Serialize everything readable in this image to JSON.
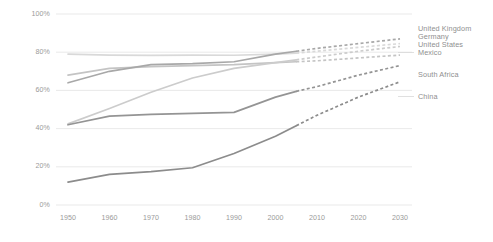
{
  "chart_data": {
    "type": "line",
    "title": "",
    "subtitle": "",
    "xlabel": "",
    "ylabel": "",
    "xlim": [
      1950,
      2030
    ],
    "ylim": [
      0,
      100
    ],
    "grid": true,
    "legend_position": "right",
    "x_ticks": [
      "1950",
      "1960",
      "1970",
      "1980",
      "1990",
      "2000",
      "2010",
      "2020",
      "2030"
    ],
    "y_ticks": [
      "0%",
      "20%",
      "40%",
      "60%",
      "80%",
      "100%"
    ],
    "y_tick_values": [
      0,
      20,
      40,
      60,
      80,
      100
    ],
    "x_tick_values": [
      1950,
      1960,
      1970,
      1980,
      1990,
      2000,
      2010,
      2020,
      2030
    ],
    "projection_start_year": 2005,
    "annotations": [
      "Solid lines are historical values; dashed lines are projections after 2005."
    ],
    "series": [
      {
        "name": "United Kingdom",
        "color": "#d9d9d9",
        "x": [
          1950,
          1960,
          1970,
          1980,
          1990,
          2000,
          2005,
          2010,
          2020,
          2030
        ],
        "values": [
          79,
          78.5,
          78.3,
          78.5,
          78.4,
          79,
          79.5,
          80.5,
          82.5,
          84.5
        ]
      },
      {
        "name": "Germany",
        "color": "#c4c4c4",
        "x": [
          1950,
          1960,
          1970,
          1980,
          1990,
          2000,
          2005,
          2010,
          2020,
          2030
        ],
        "values": [
          68,
          71.5,
          72.5,
          73,
          73.5,
          74.5,
          75,
          75.5,
          77,
          78.5
        ]
      },
      {
        "name": "United States",
        "color": "#a8a8a8",
        "x": [
          1950,
          1960,
          1970,
          1980,
          1990,
          2000,
          2005,
          2010,
          2020,
          2030
        ],
        "values": [
          64,
          70,
          73.5,
          74,
          75,
          79,
          80.5,
          82,
          84.5,
          87
        ]
      },
      {
        "name": "Mexico",
        "color": "#cccccc",
        "x": [
          1950,
          1960,
          1970,
          1980,
          1990,
          2000,
          2005,
          2010,
          2020,
          2030
        ],
        "values": [
          42.5,
          50.5,
          59,
          66.5,
          71.5,
          74.5,
          76,
          77.5,
          80.5,
          83
        ]
      },
      {
        "name": "South Africa",
        "color": "#949494",
        "x": [
          1950,
          1960,
          1970,
          1980,
          1990,
          2000,
          2005,
          2010,
          2020,
          2030
        ],
        "values": [
          42,
          46.5,
          47.5,
          48,
          48.5,
          56.5,
          59.5,
          62,
          68,
          73
        ]
      },
      {
        "name": "China",
        "color": "#8c8c8c",
        "x": [
          1950,
          1960,
          1970,
          1980,
          1990,
          2000,
          2005,
          2010,
          2020,
          2030
        ],
        "values": [
          12,
          16,
          17.5,
          19.5,
          27,
          36,
          41.5,
          47,
          56.5,
          64.5
        ]
      }
    ]
  },
  "legend": {
    "items": [
      {
        "label": "United Kingdom"
      },
      {
        "label": "Germany"
      },
      {
        "label": "United States"
      },
      {
        "label": "Mexico"
      },
      {
        "label": "South Africa"
      },
      {
        "label": "China"
      }
    ]
  },
  "edge": {
    "fragment": ""
  }
}
